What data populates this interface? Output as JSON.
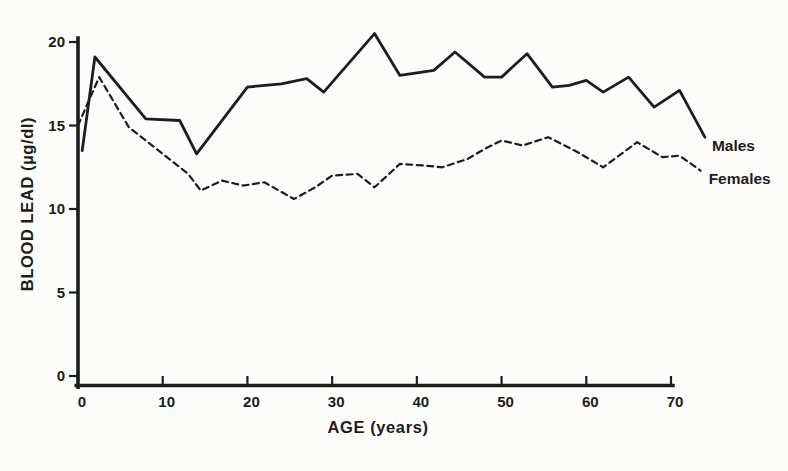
{
  "figure": {
    "background": "#fcfcfb",
    "ink": "#1d1d1d"
  },
  "chart_data": {
    "type": "line",
    "title": "",
    "xlabel": "AGE (years)",
    "ylabel": "BLOOD LEAD (µg/dl)",
    "xlim": [
      0,
      70
    ],
    "ylim": [
      0,
      20
    ],
    "x_ticks": [
      0,
      10,
      20,
      30,
      40,
      50,
      60,
      70
    ],
    "y_ticks": [
      0,
      5,
      10,
      15,
      20
    ],
    "grid": false,
    "legend_position": "line-end-labels",
    "series": [
      {
        "name": "males",
        "label": "Males",
        "style": "solid",
        "x": [
          0.5,
          2,
          8,
          12,
          14,
          20,
          24,
          27,
          29,
          35,
          38,
          42,
          44.5,
          48,
          50,
          53,
          56,
          58,
          60,
          62,
          65,
          68,
          71,
          74
        ],
        "y": [
          13.5,
          19.1,
          15.4,
          15.3,
          13.3,
          17.3,
          17.5,
          17.8,
          17.0,
          20.5,
          18.0,
          18.3,
          19.4,
          17.9,
          17.9,
          19.3,
          17.3,
          17.4,
          17.7,
          17.0,
          17.9,
          16.1,
          17.1,
          14.3
        ]
      },
      {
        "name": "females",
        "label": "Females",
        "style": "dashed",
        "x": [
          0,
          2.5,
          6,
          10,
          13,
          14.5,
          17,
          19.5,
          22,
          25.5,
          28,
          30,
          33,
          35,
          38,
          41,
          43,
          46,
          48,
          50,
          52.5,
          55.5,
          59,
          62,
          66,
          69,
          71,
          73.5
        ],
        "y": [
          15.0,
          17.9,
          14.9,
          13.3,
          12.1,
          11.1,
          11.7,
          11.4,
          11.6,
          10.6,
          11.3,
          12.0,
          12.1,
          11.3,
          12.7,
          12.6,
          12.5,
          13.0,
          13.6,
          14.1,
          13.8,
          14.3,
          13.4,
          12.5,
          14.0,
          13.1,
          13.2,
          12.3
        ]
      }
    ]
  }
}
